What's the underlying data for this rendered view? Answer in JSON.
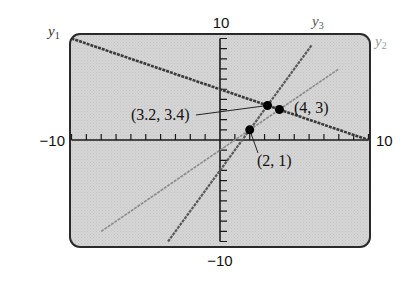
{
  "chart_data": {
    "type": "line",
    "title": "",
    "xlabel": "",
    "ylabel": "",
    "xlim": [
      -10,
      10
    ],
    "ylim": [
      -10,
      10
    ],
    "grid": false,
    "axis_labels": {
      "y_max": "10",
      "y_min": "−10",
      "x_min": "−10",
      "x_max": "10"
    },
    "series": [
      {
        "name": "y1",
        "label": "y₁",
        "equation": "y = -0.5x + 5",
        "slope": -0.5,
        "intercept": 5,
        "x_range": [
          -10,
          10
        ],
        "color": "#3a3a3a",
        "style": "solid-dark"
      },
      {
        "name": "y2",
        "label": "y₂",
        "equation": "y = x - 1",
        "slope": 1,
        "intercept": -1,
        "x_range": [
          -8,
          8
        ],
        "color": "#8a8a8a",
        "style": "solid-light"
      },
      {
        "name": "y3",
        "label": "y₃",
        "equation": "y = 2x - 3",
        "slope": 2,
        "intercept": -3,
        "x_range": [
          -3.5,
          6.2
        ],
        "color": "#5a5a5a",
        "style": "solid-medium"
      }
    ],
    "points": [
      {
        "x": 3.2,
        "y": 3.4,
        "label": "(3.2, 3.4)"
      },
      {
        "x": 4,
        "y": 3,
        "label": "(4, 3)"
      },
      {
        "x": 2,
        "y": 1,
        "label": "(2, 1)"
      }
    ]
  },
  "labels": {
    "y1": "y",
    "y1_sub": "1",
    "y2": "y",
    "y2_sub": "2",
    "y3": "y",
    "y3_sub": "3",
    "ytop": "10",
    "ybottom": "−10",
    "xleft": "−10",
    "xright": "10",
    "p1": "(3.2, 3.4)",
    "p2": "(4, 3)",
    "p3": "(2, 1)"
  },
  "colors": {
    "screen_bg": "#d4d4d4",
    "screen_border": "#2a2a2a",
    "axis": "#1a1a1a"
  }
}
